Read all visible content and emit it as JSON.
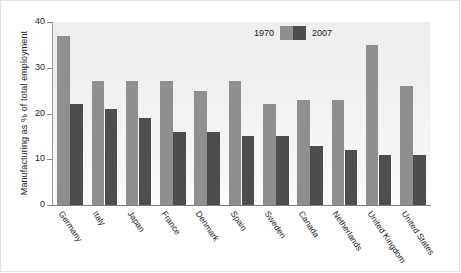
{
  "chart_data": {
    "type": "bar",
    "title": "",
    "xlabel": "",
    "ylabel": "Manufacturing as % of total employment",
    "ylim": [
      0,
      40
    ],
    "yticks": [
      0,
      10,
      20,
      30,
      40
    ],
    "grid": false,
    "legend_position": "top-center",
    "categories": [
      "Germany",
      "Italy",
      "Japan",
      "France",
      "Denmark",
      "Spain",
      "Sweden",
      "Canada",
      "Netherlands",
      "United Kingdom",
      "United States"
    ],
    "series": [
      {
        "name": "1970",
        "color": "#8f8f8f",
        "values": [
          37,
          27,
          27,
          27,
          25,
          27,
          22,
          23,
          23,
          35,
          26
        ]
      },
      {
        "name": "2007",
        "color": "#4d4d4d",
        "values": [
          22,
          21,
          19,
          16,
          16,
          15,
          15,
          13,
          12,
          11,
          11
        ]
      }
    ]
  },
  "legend": {
    "entries": [
      {
        "label": "1970",
        "color": "#8f8f8f"
      },
      {
        "label": "2007",
        "color": "#4d4d4d"
      }
    ]
  },
  "axes": {
    "y_title": "Manufacturing as % of total employment",
    "y_tick_labels": [
      "0",
      "10",
      "20",
      "30",
      "40"
    ]
  },
  "colors": {
    "series_1970": "#8f8f8f",
    "series_2007": "#4d4d4d",
    "plot_background": "#f0f0f0",
    "axis": "#8d8d8d",
    "text": "#1b1b1b"
  }
}
